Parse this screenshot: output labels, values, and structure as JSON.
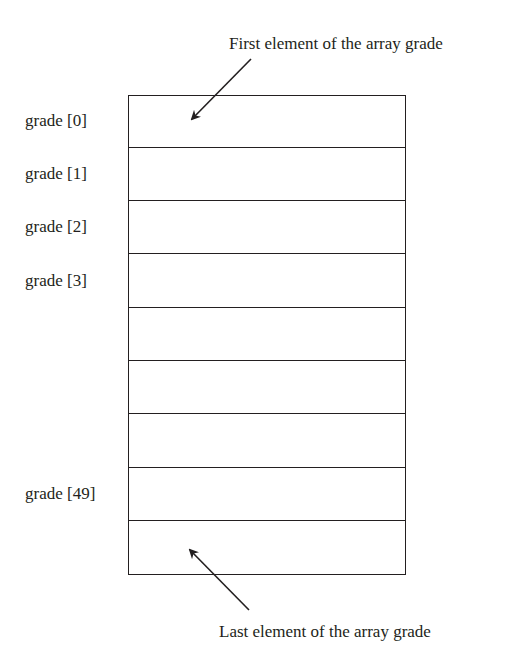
{
  "diagram": {
    "title_top": "First element of the array grade",
    "title_bottom": "Last element of the array grade",
    "array_name": "grade",
    "cell_count": 9,
    "labels": [
      {
        "text": "grade [0]",
        "row": 0
      },
      {
        "text": "grade [1]",
        "row": 1
      },
      {
        "text": "grade [2]",
        "row": 2
      },
      {
        "text": "grade [3]",
        "row": 3
      },
      {
        "text": "grade [49]",
        "row": 7
      }
    ],
    "arrows": [
      {
        "name": "first-element-arrow",
        "from": [
          251,
          59
        ],
        "to": [
          192,
          119
        ]
      },
      {
        "name": "last-element-arrow",
        "from": [
          249,
          610
        ],
        "to": [
          190,
          550
        ]
      }
    ],
    "colors": {
      "stroke": "#231f20",
      "background": "#ffffff"
    }
  }
}
